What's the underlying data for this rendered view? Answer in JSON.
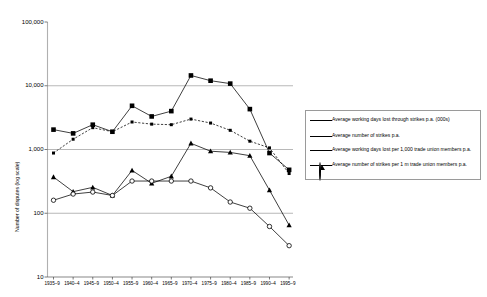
{
  "chart_data": {
    "type": "line",
    "title": "",
    "xlabel": "",
    "ylabel": "Number of disputes (log scale)",
    "yscale": "log",
    "ylim": [
      10,
      100000
    ],
    "ytick_labels": [
      "100,000",
      "10,000",
      "1,000",
      "100",
      "10"
    ],
    "ytick_values": [
      100000,
      10000,
      1000,
      100,
      10
    ],
    "grid": "horizontal",
    "gridlines_at": [
      100,
      1000,
      10000
    ],
    "legend_position": "right",
    "categories": [
      "1935–9",
      "1940–4",
      "1945–9",
      "1950–4",
      "1955–9",
      "1960–4",
      "1965–9",
      "1970–4",
      "1975–9",
      "1980–4",
      "1985–9",
      "1990–4",
      "1995–9"
    ],
    "series": [
      {
        "name": "Average working days lost through strikes p.a. (000s)",
        "marker": "filled-square",
        "linestyle": "solid",
        "color": "#000000",
        "values": [
          2050,
          1790,
          2450,
          1900,
          4850,
          3300,
          4000,
          14500,
          12000,
          10800,
          4300,
          880,
          480
        ]
      },
      {
        "name": "Average number of strikes p.a.",
        "marker": "small-filled-square",
        "linestyle": "dashed",
        "color": "#000000",
        "values": [
          880,
          1450,
          2200,
          1900,
          2700,
          2500,
          2450,
          3000,
          2600,
          2000,
          1350,
          1060,
          420
        ]
      },
      {
        "name": "Average working days lost per 1,000 trade union members p.a.",
        "marker": "filled-triangle",
        "linestyle": "solid",
        "color": "#000000",
        "values": [
          370,
          218,
          255,
          190,
          470,
          295,
          380,
          1250,
          940,
          900,
          800,
          230,
          65
        ]
      },
      {
        "name": "Average number of strikes per 1 m trade union members p.a.",
        "marker": "open-circle",
        "linestyle": "solid",
        "color": "#000000",
        "values": [
          160,
          200,
          215,
          190,
          320,
          320,
          320,
          320,
          250,
          150,
          120,
          62,
          31
        ]
      }
    ]
  },
  "legend": {
    "entries": [
      {
        "label": "Average working days lost through strikes p.a. (000s)",
        "marker": "filled-square",
        "linestyle": "solid"
      },
      {
        "label": "Average number of strikes p.a.",
        "marker": "small-filled-square",
        "linestyle": "solid"
      },
      {
        "label": "Average working days lost per 1,000 trade union members p.a.",
        "marker": "filled-triangle",
        "linestyle": "solid"
      },
      {
        "label": "Average number of strikes per 1 m trade union members p.a.",
        "marker": "open-circle",
        "linestyle": "solid"
      }
    ]
  },
  "colors": {
    "ink": "#000000",
    "gridline": "#9a9a9a",
    "axis": "#808080",
    "background": "#ffffff"
  }
}
